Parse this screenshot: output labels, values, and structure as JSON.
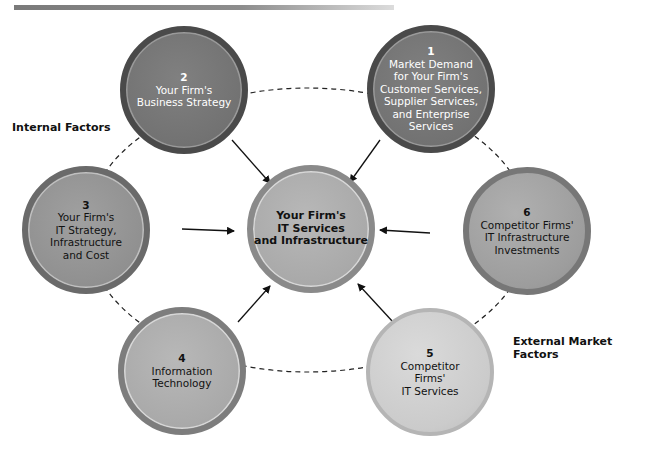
{
  "diagram": {
    "title": "",
    "group_labels": {
      "internal": "Internal Factors",
      "external": "External Market Factors"
    },
    "center": {
      "lines": [
        "Your Firm's",
        "IT Services",
        "and Infrastructure"
      ]
    },
    "nodes": [
      {
        "id": 1,
        "num": "1",
        "lines": [
          "Market Demand",
          "for Your Firm's",
          "Customer Services,",
          "Supplier Services,",
          "and Enterprise",
          "Services"
        ]
      },
      {
        "id": 2,
        "num": "2",
        "lines": [
          "Your Firm's",
          "Business Strategy"
        ]
      },
      {
        "id": 3,
        "num": "3",
        "lines": [
          "Your Firm's",
          "IT Strategy,",
          "Infrastructure",
          "and Cost"
        ]
      },
      {
        "id": 4,
        "num": "4",
        "lines": [
          "Information",
          "Technology"
        ]
      },
      {
        "id": 5,
        "num": "5",
        "lines": [
          "Competitor",
          "Firms'",
          "IT Services"
        ]
      },
      {
        "id": 6,
        "num": "6",
        "lines": [
          "Competitor Firms'",
          "IT Infrastructure",
          "Investments"
        ]
      }
    ],
    "edges": [
      {
        "from": 1,
        "to": "center"
      },
      {
        "from": 2,
        "to": "center"
      },
      {
        "from": 3,
        "to": "center"
      },
      {
        "from": 4,
        "to": "center"
      },
      {
        "from": 5,
        "to": "center"
      },
      {
        "from": 6,
        "to": "center"
      }
    ],
    "colors": {
      "dark_node": "#727272",
      "mid_node": "#909090",
      "center_node": "#a9a9a9",
      "light_node": "#cbcbcb",
      "arrow": "#111111"
    }
  }
}
